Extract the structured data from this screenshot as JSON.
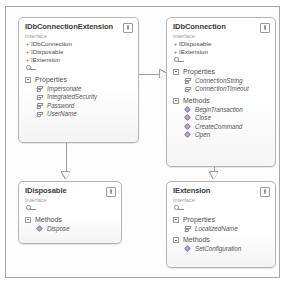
{
  "diagram": {
    "type": "uml-class-diagram",
    "stereotype_label": "Interface",
    "classes": [
      {
        "id": "idbconnectionextension",
        "name": "IDbConnectionExtension",
        "stereotype": "Interface",
        "badge": "interface-badge-icon",
        "bases": [
          "IDbConnection",
          "IDisposable",
          "IExtension"
        ],
        "groups": [
          {
            "label": "Properties",
            "kind": "property",
            "members": [
              "Impersonate",
              "IntegratedSecurity",
              "Password",
              "UserName"
            ]
          }
        ]
      },
      {
        "id": "idbconnection",
        "name": "IDbConnection",
        "stereotype": "Interface",
        "badge": "interface-badge-icon",
        "bases": [
          "IDisposable",
          "IExtension"
        ],
        "groups": [
          {
            "label": "Properties",
            "kind": "property",
            "members": [
              "ConnectionString",
              "ConnectionTimeout"
            ]
          },
          {
            "label": "Methods",
            "kind": "method",
            "members": [
              "BeginTransaction",
              "Close",
              "CreateCommand",
              "Open"
            ]
          }
        ]
      },
      {
        "id": "idisposable",
        "name": "IDisposable",
        "stereotype": "Interface",
        "badge": "interface-badge-icon",
        "bases": [],
        "groups": [
          {
            "label": "Methods",
            "kind": "method",
            "members": [
              "Dispose"
            ]
          }
        ]
      },
      {
        "id": "iextension",
        "name": "IExtension",
        "stereotype": "Interface",
        "badge": "interface-badge-icon",
        "bases": [],
        "groups": [
          {
            "label": "Properties",
            "kind": "property",
            "members": [
              "LocalizedName"
            ]
          },
          {
            "label": "Methods",
            "kind": "method",
            "members": [
              "SetConfiguration"
            ]
          }
        ]
      }
    ],
    "connectors": [
      {
        "name": "inheritance-extension-to-connection",
        "from": "idbconnectionextension",
        "to": "idbconnection",
        "arrow": "hollow-triangle-right"
      },
      {
        "name": "inheritance-extension-to-disposable",
        "from": "idbconnectionextension",
        "to": "idisposable",
        "arrow": "hollow-triangle-down"
      },
      {
        "name": "inheritance-connection-to-iextension",
        "from": "idbconnection",
        "to": "iextension",
        "arrow": "hollow-triangle-down"
      }
    ],
    "colors": {
      "box_border": "#b4b4b4",
      "frame_border": "#a8a8a8",
      "connector": "#9e9e9e",
      "title_text": "#3b3b3b",
      "stereotype_text": "#9d9d9d",
      "member_text": "#555555",
      "method_icon": "#b9a9cf"
    }
  }
}
